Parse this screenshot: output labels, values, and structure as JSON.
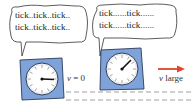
{
  "diagram": {
    "left_clock": {
      "speech": [
        "tick..tick..tick..",
        "tick..tick..tick.."
      ],
      "velocity_var": "v",
      "velocity_label": " = 0"
    },
    "right_clock": {
      "speech": [
        "tick......tick......",
        "tick......tick......"
      ],
      "velocity_var": "v",
      "velocity_label": " large"
    },
    "colors": {
      "clock_body": "#7fa3d8",
      "clock_outline": "#2a3a5a",
      "arrow": "#e0442a",
      "dashed_line": "#888888"
    }
  }
}
